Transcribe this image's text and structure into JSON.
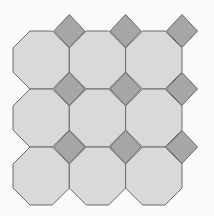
{
  "pattern": {
    "title": "Octagon and square tiling",
    "background": "#fafafa",
    "octagon_fill": "#d9d9d9",
    "square_fill": "#a6a6a6",
    "stroke": "#6a6a6a",
    "grid": {
      "x_edges": [
        13,
        69.3,
        125.6,
        182
      ],
      "y_edges": [
        31,
        89,
        147,
        205
      ],
      "corner_cut_x": 17,
      "corner_cut_y": 17,
      "square_half_x": 15.5,
      "square_half_y": 16.5
    },
    "squares": [
      [
        1,
        0
      ],
      [
        2,
        0
      ],
      [
        3,
        0
      ],
      [
        1,
        1
      ],
      [
        2,
        1
      ],
      [
        3,
        1
      ],
      [
        1,
        2
      ],
      [
        2,
        2
      ],
      [
        3,
        2
      ]
    ]
  }
}
